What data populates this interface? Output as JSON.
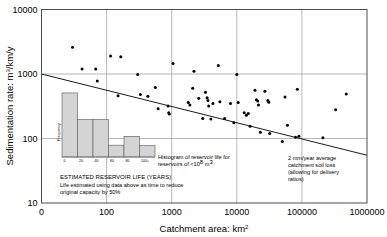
{
  "chart_data": {
    "type": "scatter",
    "title": "",
    "xlabel": "Catchment area: km²",
    "ylabel": "Sedimentation rate: m³/km/y",
    "xscale": "log",
    "yscale": "log",
    "xlim": [
      10,
      1000000
    ],
    "ylim": [
      10,
      10000
    ],
    "xticks": [
      "0",
      "100",
      "1000",
      "10000",
      "100000",
      "1000000"
    ],
    "xtick_values": [
      10,
      100,
      1000,
      10000,
      100000,
      1000000
    ],
    "yticks": [
      "10",
      "100",
      "1000",
      "10000"
    ],
    "ytick_values": [
      10,
      100,
      1000,
      10000
    ],
    "grid": true,
    "legend": "none",
    "series": [
      {
        "name": "Reservoir sedimentation observations",
        "marker": "filled-circle",
        "color": "#000000",
        "points": [
          [
            30,
            2600
          ],
          [
            42,
            1200
          ],
          [
            68,
            1200
          ],
          [
            72,
            780
          ],
          [
            115,
            1900
          ],
          [
            165,
            1850
          ],
          [
            150,
            460
          ],
          [
            300,
            980
          ],
          [
            330,
            480
          ],
          [
            430,
            450
          ],
          [
            560,
            620
          ],
          [
            620,
            290
          ],
          [
            880,
            320
          ],
          [
            900,
            250
          ],
          [
            920,
            240
          ],
          [
            1050,
            1450
          ],
          [
            1800,
            360
          ],
          [
            1900,
            330
          ],
          [
            2100,
            600
          ],
          [
            2200,
            1100
          ],
          [
            2600,
            420
          ],
          [
            3000,
            205
          ],
          [
            3300,
            520
          ],
          [
            3500,
            430
          ],
          [
            3600,
            390
          ],
          [
            3700,
            320
          ],
          [
            4000,
            200
          ],
          [
            4300,
            350
          ],
          [
            5200,
            1350
          ],
          [
            5500,
            370
          ],
          [
            6500,
            205
          ],
          [
            8000,
            350
          ],
          [
            9000,
            175
          ],
          [
            10000,
            980
          ],
          [
            10500,
            360
          ],
          [
            13000,
            250
          ],
          [
            14000,
            230
          ],
          [
            15000,
            245
          ],
          [
            16000,
            155
          ],
          [
            19000,
            560
          ],
          [
            20000,
            400
          ],
          [
            21000,
            380
          ],
          [
            21500,
            330
          ],
          [
            23000,
            125
          ],
          [
            27000,
            540
          ],
          [
            30000,
            390
          ],
          [
            31000,
            365
          ],
          [
            32000,
            120
          ],
          [
            50000,
            90
          ],
          [
            55000,
            440
          ],
          [
            60000,
            160
          ],
          [
            80000,
            105
          ],
          [
            85000,
            580
          ],
          [
            90000,
            108
          ],
          [
            210000,
            103
          ],
          [
            330000,
            280
          ],
          [
            480000,
            490
          ]
        ]
      }
    ],
    "trendline": {
      "label": "2 mm/year average catchment soil loss (allowing for delivery ratios)",
      "points": [
        [
          10,
          1000
        ],
        [
          1000000,
          55
        ]
      ],
      "color": "#000000"
    },
    "inset_histogram": {
      "type": "bar",
      "title": "Histogram of reservoir life for reservoirs of <10⁸ m³",
      "xlabel": "ESTIMATED RESERVOIR LIFE (YEARS)",
      "ylabel": "Frequency",
      "categories": [
        "0",
        "20",
        "40",
        "60",
        "80",
        "100+"
      ],
      "xtick_labels": [
        "0",
        "20",
        "40",
        "60",
        "80",
        "100+"
      ],
      "values": [
        6.5,
        3.8,
        3.8,
        1.2,
        2.1,
        1.15
      ],
      "bar_color": "#d4d4d4",
      "bar_edge": "#555555",
      "note_line1": "Life estimated using data above as time to reduce",
      "note_line2": "original capacity by 50%"
    }
  },
  "annotations": {
    "histogram_caption_line1": "Histogram of reservoir life for",
    "histogram_caption_line2_pre": "reservoirs of <10",
    "histogram_caption_line2_sup": "8",
    "histogram_caption_line2_post": " m",
    "histogram_caption_line2_sup2": "3",
    "reservoir_life_title": "ESTIMATED RESERVOIR LIFE (YEARS)",
    "reservoir_life_note1": "Life estimated using data above as time to reduce",
    "reservoir_life_note2": "original capacity by 50%",
    "soil_loss_line1": "2 mm/year average",
    "soil_loss_line2": "catchment soil loss",
    "soil_loss_line3": "(allowing for delivery",
    "soil_loss_line4": "ratios)",
    "frequency_label": "Frequency"
  },
  "axes": {
    "x_title": "Catchment area: km",
    "x_title_sup": "2",
    "y_title_pre": "Sedimentation rate: m",
    "y_title_sup": "3",
    "y_title_post": "/km/y",
    "x_tick_0": "0",
    "x_tick_1": "100",
    "x_tick_2": "1000",
    "x_tick_3": "10000",
    "x_tick_4": "100000",
    "x_tick_5": "1000000",
    "y_tick_0": "10",
    "y_tick_1": "100",
    "y_tick_2": "1000",
    "y_tick_3": "10000"
  },
  "hist_ticks": {
    "t0": "0",
    "t1": "20",
    "t2": "40",
    "t3": "60",
    "t4": "80",
    "t5": "100+"
  },
  "colors": {
    "frame": "#4d4d4d",
    "grid": "#9a9a9a",
    "marker": "#000000",
    "bar_fill": "#d2d2d2",
    "bar_stroke": "#5a5a5a",
    "text": "#000000"
  }
}
